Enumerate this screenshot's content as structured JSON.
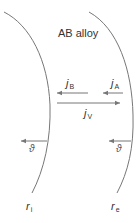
{
  "title": "AB alloy",
  "colors": {
    "line": "#777777",
    "text": "#333333",
    "background": "#ffffff"
  },
  "fluxes": {
    "jB": {
      "symbol": "j",
      "sub": "B",
      "direction": "left"
    },
    "jA": {
      "symbol": "j",
      "sub": "A",
      "direction": "left"
    },
    "jV": {
      "symbol": "j",
      "sub": "V",
      "direction": "right"
    }
  },
  "interfaces": {
    "inner": {
      "symbol": "r",
      "sub": "i",
      "velocity_label": "ϑ"
    },
    "outer": {
      "symbol": "r",
      "sub": "e",
      "velocity_label": "ϑ"
    }
  }
}
